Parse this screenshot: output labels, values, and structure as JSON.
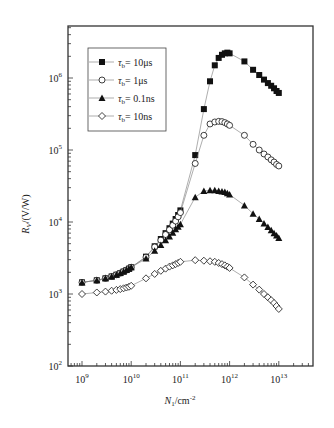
{
  "chart_data": {
    "type": "scatter",
    "title": "",
    "xlabel": "N1/cm^-2",
    "xlabel_main": "N",
    "xlabel_sub": "1",
    "xlabel_unit": "/cm",
    "xlabel_sup": "-2",
    "ylabel": "RV/(V/W)",
    "ylabel_main": "R",
    "ylabel_sub": "V",
    "ylabel_unit": "/(V/W)",
    "xscale": "log",
    "yscale": "log",
    "xlim": [
      500000000.0,
      40000000000000.0
    ],
    "ylim": [
      100,
      5000000.0
    ],
    "grid": false,
    "legend_position": "upper left",
    "x_ticks": [
      {
        "value": 1000000000.0,
        "base": "10",
        "exp": "9"
      },
      {
        "value": 10000000000.0,
        "base": "10",
        "exp": "10"
      },
      {
        "value": 100000000000.0,
        "base": "10",
        "exp": "11"
      },
      {
        "value": 1000000000000.0,
        "base": "10",
        "exp": "12"
      },
      {
        "value": 10000000000000.0,
        "base": "10",
        "exp": "13"
      }
    ],
    "y_ticks": [
      {
        "value": 100.0,
        "base": "10",
        "exp": "2"
      },
      {
        "value": 1000.0,
        "base": "10",
        "exp": "3"
      },
      {
        "value": 10000.0,
        "base": "10",
        "exp": "4"
      },
      {
        "value": 100000.0,
        "base": "10",
        "exp": "5"
      },
      {
        "value": 1000000.0,
        "base": "10",
        "exp": "6"
      }
    ],
    "series": [
      {
        "name": "τb = 10μs",
        "label_tau": "τ",
        "label_sub": "b",
        "label_value": "= 10μs",
        "marker": "square-filled",
        "x": [
          1000000000.0,
          2000000000.0,
          3000000000.0,
          4000000000.0,
          5000000000.0,
          6000000000.0,
          7000000000.0,
          8000000000.0,
          9000000000.0,
          10000000000.0,
          20000000000.0,
          30000000000.0,
          40000000000.0,
          50000000000.0,
          60000000000.0,
          70000000000.0,
          80000000000.0,
          90000000000.0,
          100000000000.0,
          200000000000.0,
          300000000000.0,
          400000000000.0,
          500000000000.0,
          600000000000.0,
          700000000000.0,
          800000000000.0,
          900000000000.0,
          1000000000000.0,
          2000000000000.0,
          3000000000000.0,
          4000000000000.0,
          5000000000000.0,
          6000000000000.0,
          7000000000000.0,
          8000000000000.0,
          9000000000000.0,
          10000000000000.0
        ],
        "y": [
          1450,
          1550,
          1650,
          1750,
          1850,
          1950,
          2050,
          2150,
          2250,
          2350,
          3300,
          4600,
          5800,
          7000,
          8200,
          9500,
          11000,
          12500,
          14500,
          85000,
          370000,
          900000,
          1500000,
          1900000,
          2100000,
          2200000,
          2250000,
          2200000,
          1700000,
          1300000,
          1100000,
          950000,
          850000,
          780000,
          720000,
          660000,
          620000
        ]
      },
      {
        "name": "τb = 1μs",
        "label_tau": "τ",
        "label_sub": "b",
        "label_value": "= 1μs",
        "marker": "circle-open",
        "x": [
          1000000000.0,
          2000000000.0,
          3000000000.0,
          4000000000.0,
          5000000000.0,
          6000000000.0,
          7000000000.0,
          8000000000.0,
          9000000000.0,
          10000000000.0,
          20000000000.0,
          30000000000.0,
          40000000000.0,
          50000000000.0,
          60000000000.0,
          70000000000.0,
          80000000000.0,
          90000000000.0,
          100000000000.0,
          200000000000.0,
          300000000000.0,
          400000000000.0,
          500000000000.0,
          600000000000.0,
          700000000000.0,
          800000000000.0,
          900000000000.0,
          1000000000000.0,
          2000000000000.0,
          3000000000000.0,
          4000000000000.0,
          5000000000000.0,
          6000000000000.0,
          7000000000000.0,
          8000000000000.0,
          9000000000000.0,
          10000000000000.0
        ],
        "y": [
          1450,
          1550,
          1650,
          1750,
          1850,
          1950,
          2050,
          2150,
          2250,
          2350,
          3250,
          4500,
          5600,
          6700,
          7800,
          9000,
          10300,
          11800,
          13500,
          65000,
          160000,
          230000,
          245000,
          250000,
          248000,
          240000,
          230000,
          220000,
          160000,
          120000,
          100000,
          88000,
          80000,
          73000,
          68000,
          63000,
          60000
        ]
      },
      {
        "name": "τb = 0.1ns",
        "label_tau": "τ",
        "label_sub": "b",
        "label_value": "= 0.1ns",
        "marker": "triangle-filled",
        "x": [
          1000000000.0,
          2000000000.0,
          3000000000.0,
          4000000000.0,
          5000000000.0,
          6000000000.0,
          7000000000.0,
          8000000000.0,
          9000000000.0,
          10000000000.0,
          20000000000.0,
          30000000000.0,
          40000000000.0,
          50000000000.0,
          60000000000.0,
          70000000000.0,
          80000000000.0,
          90000000000.0,
          100000000000.0,
          200000000000.0,
          300000000000.0,
          400000000000.0,
          500000000000.0,
          600000000000.0,
          700000000000.0,
          800000000000.0,
          900000000000.0,
          1000000000000.0,
          2000000000000.0,
          3000000000000.0,
          4000000000000.0,
          5000000000000.0,
          6000000000000.0,
          7000000000000.0,
          8000000000000.0,
          9000000000000.0,
          10000000000000.0
        ],
        "y": [
          1450,
          1550,
          1650,
          1750,
          1850,
          1950,
          2050,
          2150,
          2250,
          2350,
          3100,
          4000,
          4800,
          5600,
          6300,
          7100,
          7900,
          8600,
          9300,
          22000,
          27000,
          27500,
          27500,
          27000,
          26500,
          26000,
          25000,
          24000,
          17000,
          13000,
          11000,
          9500,
          8500,
          7700,
          7000,
          6500,
          6000
        ]
      },
      {
        "name": "τb = 10ns",
        "label_tau": "τ",
        "label_sub": "b",
        "label_value": "= 10ns",
        "marker": "diamond-open",
        "x": [
          1000000000.0,
          2000000000.0,
          3000000000.0,
          4000000000.0,
          5000000000.0,
          6000000000.0,
          7000000000.0,
          8000000000.0,
          9000000000.0,
          10000000000.0,
          20000000000.0,
          30000000000.0,
          40000000000.0,
          50000000000.0,
          60000000000.0,
          70000000000.0,
          80000000000.0,
          90000000000.0,
          100000000000.0,
          200000000000.0,
          300000000000.0,
          400000000000.0,
          500000000000.0,
          600000000000.0,
          700000000000.0,
          800000000000.0,
          900000000000.0,
          1000000000000.0,
          2000000000000.0,
          3000000000000.0,
          4000000000000.0,
          5000000000000.0,
          6000000000000.0,
          7000000000000.0,
          8000000000000.0,
          9000000000000.0,
          10000000000000.0
        ],
        "y": [
          1000,
          1050,
          1080,
          1110,
          1140,
          1170,
          1200,
          1230,
          1260,
          1300,
          1650,
          1900,
          2100,
          2250,
          2400,
          2500,
          2600,
          2700,
          2800,
          2950,
          2900,
          2850,
          2800,
          2700,
          2600,
          2500,
          2400,
          2300,
          1700,
          1350,
          1150,
          1000,
          900,
          820,
          750,
          680,
          620
        ]
      }
    ]
  }
}
